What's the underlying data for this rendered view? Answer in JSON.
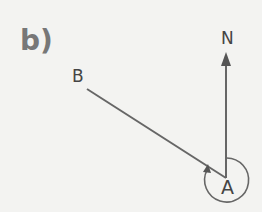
{
  "figure": {
    "part_label": "b)",
    "points": {
      "B": "B",
      "N": "N",
      "A": "A"
    },
    "colors": {
      "line": "#666666",
      "text": "#444444",
      "part_label": "#777777",
      "background": "#f3f3f1"
    }
  }
}
